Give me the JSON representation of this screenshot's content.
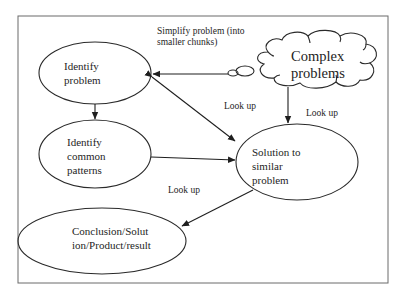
{
  "header_fragment": "problem-solving process",
  "diagram": {
    "nodes": [
      {
        "id": "identify-problem",
        "shape": "ellipse",
        "lines": [
          "Identify",
          "problem"
        ]
      },
      {
        "id": "identify-patterns",
        "shape": "ellipse",
        "lines": [
          "Identify",
          "common",
          "patterns"
        ]
      },
      {
        "id": "solution-similar",
        "shape": "ellipse",
        "lines": [
          "Solution to",
          "similar",
          "problem"
        ]
      },
      {
        "id": "conclusion",
        "shape": "ellipse",
        "lines": [
          "Conclusion/Solut",
          "ion/Product/result"
        ]
      },
      {
        "id": "complex-problems",
        "shape": "cloud",
        "lines": [
          "Complex",
          "problems"
        ]
      }
    ],
    "edges": [
      {
        "from": "complex-problems",
        "to": "identify-problem",
        "label": "Simplify problem (into smaller chunks)",
        "label_lines": [
          "Simplify problem (into",
          "smaller chunks)"
        ]
      },
      {
        "from": "identify-problem",
        "to": "identify-patterns",
        "label": ""
      },
      {
        "from": "identify-problem",
        "to": "solution-similar",
        "label": "Look up",
        "bidirectional": true
      },
      {
        "from": "complex-problems",
        "to": "solution-similar",
        "label": "Look up"
      },
      {
        "from": "identify-patterns",
        "to": "solution-similar",
        "label": ""
      },
      {
        "from": "solution-similar",
        "to": "conclusion",
        "label": "Look up"
      }
    ]
  }
}
